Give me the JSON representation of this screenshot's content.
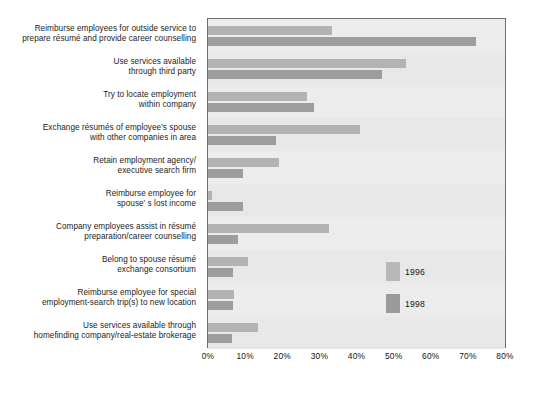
{
  "chart_data": {
    "type": "bar",
    "orientation": "horizontal",
    "title": "",
    "subtitle": "",
    "xlabel": "",
    "ylabel": "",
    "xlim": [
      0,
      80
    ],
    "xticks": [
      "0%",
      "10%",
      "20%",
      "30%",
      "40%",
      "50%",
      "60%",
      "70%",
      "80%"
    ],
    "xtick_values": [
      0,
      10,
      20,
      30,
      40,
      50,
      60,
      70,
      80
    ],
    "grid": true,
    "legend_position": "inside-right",
    "categories": [
      {
        "line1": "Reimburse employees for outside service to",
        "line2": "prepare résumé and provide career counselling"
      },
      {
        "line1": "Use services available",
        "line2": "through third party"
      },
      {
        "line1": "Try to locate employment",
        "line2": "within company"
      },
      {
        "line1": "Exchange résumés of employee's spouse",
        "line2": "with other companies in area"
      },
      {
        "line1": "Retain employment agency/",
        "line2": "executive search firm"
      },
      {
        "line1": "Reimburse employee for",
        "line2": "spouse' s lost income"
      },
      {
        "line1": "Company employees assist in résumé",
        "line2": "preparation/career counselling"
      },
      {
        "line1": "Belong to spouse résumé",
        "line2": "exchange consortium"
      },
      {
        "line1": "Reimburse employee for special",
        "line2": "employment-search trip(s) to new location"
      },
      {
        "line1": "Use services available through",
        "line2": "homefinding company/real-estate brokerage"
      }
    ],
    "series": [
      {
        "name": "1996",
        "color": "#b3b3b3",
        "values": [
          33.4,
          53.2,
          26.7,
          41.0,
          19.0,
          1.0,
          32.5,
          10.7,
          7.0,
          13.4
        ]
      },
      {
        "name": "1998",
        "color": "#9d9d9d",
        "values": [
          72.2,
          46.9,
          28.6,
          18.2,
          9.4,
          9.4,
          8.0,
          6.7,
          6.7,
          6.4
        ]
      }
    ]
  },
  "legend": {
    "items": [
      {
        "label": "1996",
        "color": "#b8b8b8"
      },
      {
        "label": "1998",
        "color": "#9a9a9a"
      }
    ]
  }
}
